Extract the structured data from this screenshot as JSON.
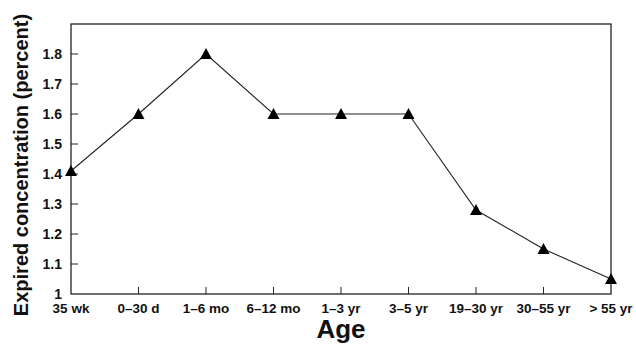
{
  "chart_data": {
    "type": "line",
    "title": "",
    "xlabel": "Age",
    "ylabel": "Expired concentration (percent)",
    "categories": [
      "35 wk",
      "0–30 d",
      "1–6 mo",
      "6–12 mo",
      "1–3 yr",
      "3–5 yr",
      "19–30 yr",
      "30–55 yr",
      "> 55 yr"
    ],
    "series": [
      {
        "name": "Expired concentration",
        "marker": "triangle",
        "color": "#000000",
        "values": [
          1.41,
          1.6,
          1.8,
          1.6,
          1.6,
          1.6,
          1.28,
          1.15,
          1.05
        ]
      }
    ],
    "yticks": [
      1,
      1.1,
      1.2,
      1.3,
      1.4,
      1.5,
      1.6,
      1.7,
      1.8
    ],
    "ytick_labels": [
      "1",
      "1.1",
      "1.2",
      "1.3",
      "1.4",
      "1.5",
      "1.6",
      "1.7",
      "1.8"
    ],
    "ylim": [
      1,
      1.9
    ],
    "grid": false,
    "legend": null
  },
  "caption_partial": "cut off (illegible)"
}
